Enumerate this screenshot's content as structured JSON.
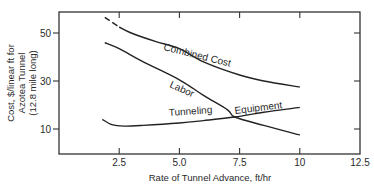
{
  "chart_data": {
    "type": "line",
    "title": "",
    "xlabel": "Rate of Tunnel Advance, ft/hr",
    "ylabel_lines": [
      "Cost, $/linear ft for",
      "Azotea Tunnel",
      "(12.8 mile long)"
    ],
    "xlim": [
      0,
      12.5
    ],
    "ylim": [
      0,
      58
    ],
    "x_ticks": [
      2.5,
      5.0,
      7.5,
      10,
      12.5
    ],
    "x_tick_labels": [
      "2.5",
      "5.0",
      "7.5",
      "10",
      "12.5"
    ],
    "y_ticks": [
      10,
      30,
      50
    ],
    "y_tick_labels": [
      "10",
      "30",
      "50"
    ],
    "grid": false,
    "legend": "inline curve labels",
    "series": [
      {
        "name": "Combined Cost",
        "label": "Combined Cost",
        "dashed_until_x": 2.5,
        "points": [
          [
            1.9,
            56.5
          ],
          [
            2.5,
            52.5
          ],
          [
            3.0,
            50.0
          ],
          [
            4.0,
            46.5
          ],
          [
            5.0,
            43.5
          ],
          [
            6.0,
            38.0
          ],
          [
            7.5,
            32.5
          ],
          [
            8.5,
            30.0
          ],
          [
            10.0,
            27.5
          ]
        ]
      },
      {
        "name": "Labor",
        "label": "Labor",
        "points": [
          [
            1.9,
            46.0
          ],
          [
            2.5,
            43.5
          ],
          [
            3.5,
            38.0
          ],
          [
            5.0,
            30.5
          ],
          [
            6.0,
            24.0
          ],
          [
            7.0,
            18.0
          ],
          [
            7.3,
            15.0
          ],
          [
            8.5,
            11.5
          ],
          [
            10.0,
            7.5
          ]
        ]
      },
      {
        "name": "Tunneling Equipment",
        "label_parts": [
          "Tunneling",
          "Equipment"
        ],
        "points": [
          [
            1.8,
            14.0
          ],
          [
            2.2,
            11.8
          ],
          [
            2.7,
            11.2
          ],
          [
            3.5,
            11.5
          ],
          [
            5.0,
            12.5
          ],
          [
            6.0,
            13.5
          ],
          [
            7.3,
            15.0
          ],
          [
            8.5,
            17.0
          ],
          [
            10.0,
            19.0
          ]
        ]
      }
    ]
  },
  "labels": {
    "combined": "Combined Cost",
    "labor": "Labor",
    "tunneling": "Tunneling",
    "equipment": "Equipment"
  }
}
